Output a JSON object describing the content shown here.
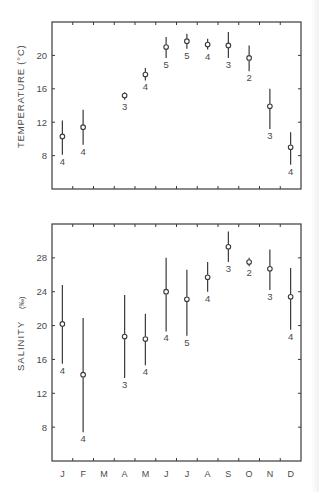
{
  "chart_data": [
    {
      "type": "scatter",
      "subtype": "errorbar",
      "title": "",
      "xlabel": "",
      "ylabel": "TEMPERATURE (°C)",
      "categories": [
        "J",
        "F",
        "M",
        "A",
        "M",
        "J",
        "J",
        "A",
        "S",
        "O",
        "N",
        "D"
      ],
      "yticks": [
        8,
        12,
        16,
        20
      ],
      "ylim": [
        4,
        24
      ],
      "grid": false,
      "series": [
        {
          "name": "Mean temperature",
          "values": [
            10.3,
            11.4,
            null,
            15.2,
            17.7,
            21.0,
            21.7,
            21.3,
            21.2,
            19.7,
            13.9,
            9.0
          ],
          "upper": [
            12.2,
            13.5,
            null,
            15.6,
            18.5,
            22.2,
            22.6,
            22.0,
            22.8,
            21.2,
            16.0,
            10.8
          ],
          "lower": [
            8.1,
            9.3,
            null,
            14.7,
            17.0,
            19.7,
            20.8,
            20.7,
            19.7,
            18.1,
            11.2,
            6.9
          ],
          "n": [
            "4",
            "4",
            null,
            "3",
            "4",
            "5",
            "5",
            "4",
            "3",
            "2",
            "3",
            "4"
          ]
        }
      ]
    },
    {
      "type": "scatter",
      "subtype": "errorbar",
      "title": "",
      "xlabel": "",
      "ylabel": "SALINITY (‰)",
      "categories": [
        "J",
        "F",
        "M",
        "A",
        "M",
        "J",
        "J",
        "A",
        "S",
        "O",
        "N",
        "D"
      ],
      "yticks": [
        8,
        12,
        16,
        20,
        24,
        28
      ],
      "ylim": [
        4,
        32
      ],
      "grid": false,
      "series": [
        {
          "name": "Mean salinity",
          "values": [
            20.2,
            14.2,
            null,
            18.7,
            18.4,
            24.0,
            23.1,
            25.7,
            29.3,
            27.5,
            26.7,
            23.4
          ],
          "upper": [
            24.8,
            20.9,
            null,
            23.6,
            21.4,
            28.0,
            26.6,
            27.5,
            31.1,
            28.0,
            29.0,
            26.8
          ],
          "lower": [
            15.5,
            7.4,
            null,
            13.8,
            15.3,
            19.3,
            18.8,
            24.0,
            27.5,
            27.0,
            24.2,
            19.5
          ],
          "n": [
            "4",
            "4",
            null,
            "3",
            "4",
            "4",
            "5",
            "4",
            "3",
            "2",
            "3",
            "4"
          ]
        }
      ]
    }
  ],
  "labels": {
    "top_ylabel": "TEMPERATURE (°C)",
    "bottom_ylabel_text": "SALINITY",
    "bottom_ylabel_unit": "(‰)",
    "top_tick_labels": [
      "20",
      "16",
      "12",
      "8"
    ],
    "bottom_tick_labels": [
      "28",
      "24",
      "20",
      "16",
      "12",
      "8"
    ],
    "month_labels": [
      "J",
      "F",
      "M",
      "A",
      "M",
      "J",
      "J",
      "A",
      "S",
      "O",
      "N",
      "D"
    ]
  },
  "colors": {
    "ink": "#3a3a3a",
    "background": "#ffffff"
  }
}
